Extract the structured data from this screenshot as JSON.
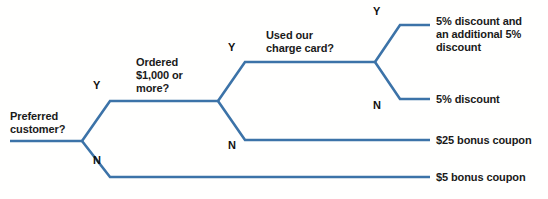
{
  "diagram": {
    "type": "decision-tree",
    "line_color": "#3c73a8",
    "line_width": 2.6,
    "background_color": "#fffffe",
    "text_color": "#1a1a1a"
  },
  "nodes": [
    {
      "id": "preferred-customer",
      "question": "Preferred\ncustomer?",
      "line1": "Preferred",
      "line2": "customer?",
      "x": 82,
      "y": 141,
      "label_x": 10,
      "label_y": 110
    },
    {
      "id": "ordered-1000-or-more",
      "question": "Ordered\n$1,000 or\nmore?",
      "line1": "Ordered",
      "line2": "$1,000 or",
      "line3": "more?",
      "x": 218,
      "y": 101,
      "label_x": 136,
      "label_y": 56
    },
    {
      "id": "used-our-charge-card",
      "question": "Used our\ncharge card?",
      "line1": "Used our",
      "line2": "charge card?",
      "x": 375,
      "y": 62,
      "label_x": 266,
      "label_y": 29
    }
  ],
  "branch_labels": [
    {
      "id": "n1-yes",
      "text": "Y",
      "x": 93,
      "y": 80
    },
    {
      "id": "n1-no",
      "text": "N",
      "x": 93,
      "y": 155
    },
    {
      "id": "n2-yes",
      "text": "Y",
      "x": 228,
      "y": 42
    },
    {
      "id": "n2-no",
      "text": "N",
      "x": 228,
      "y": 140
    },
    {
      "id": "n3-yes",
      "text": "Y",
      "x": 373,
      "y": 6
    },
    {
      "id": "n3-no",
      "text": "N",
      "x": 373,
      "y": 100
    }
  ],
  "outcomes": [
    {
      "id": "outcome-5-plus-5",
      "text": "5% discount and an additional 5% discount",
      "line1": "5% discount and",
      "line2": "an additional 5%",
      "line3": "discount",
      "y": 25,
      "label_x": 436,
      "label_y": 15
    },
    {
      "id": "outcome-5-percent",
      "text": "5% discount",
      "line1": "5% discount",
      "y": 99,
      "label_x": 436,
      "label_y": 93
    },
    {
      "id": "outcome-25-coupon",
      "text": "$25 bonus coupon",
      "line1": "$25 bonus coupon",
      "y": 140,
      "label_x": 436,
      "label_y": 134
    },
    {
      "id": "outcome-5-coupon",
      "text": "$5 bonus coupon",
      "line1": "$5 bonus coupon",
      "y": 177,
      "label_x": 436,
      "label_y": 171
    }
  ],
  "geometry": {
    "entry_x_start": 10,
    "outcome_line_end_x": 430,
    "node1_split_x": 110,
    "node2_split_x": 245,
    "node3_split_x": 400
  }
}
